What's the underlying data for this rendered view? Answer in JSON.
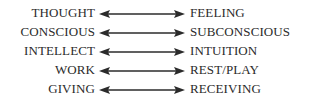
{
  "diagram": {
    "type": "bidirectional-pairs",
    "arrow_color": "#2b2b2b",
    "pairs": [
      {
        "left": "THOUGHT",
        "right": "FEELING"
      },
      {
        "left": "CONSCIOUS",
        "right": "SUBCONSCIOUS"
      },
      {
        "left": "INTELLECT",
        "right": "INTUITION"
      },
      {
        "left": "WORK",
        "right": "REST/PLAY"
      },
      {
        "left": "GIVING",
        "right": "RECEIVING"
      }
    ]
  }
}
